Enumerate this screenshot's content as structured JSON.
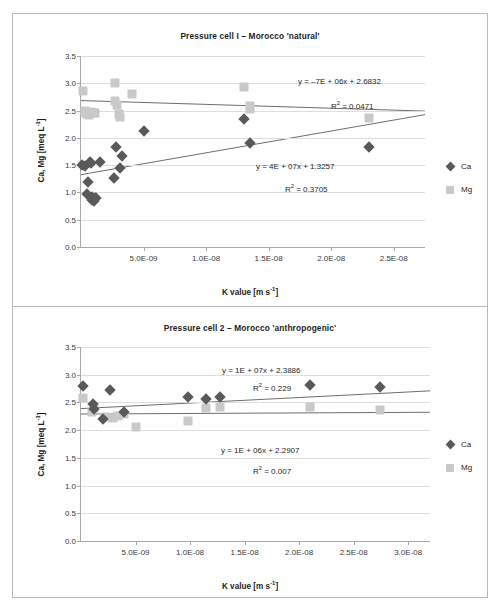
{
  "figure": {
    "panels": [
      {
        "id": "pressure-cell-1",
        "title": "Pressure cell I – Morocco 'natural'",
        "axis": {
          "x_title": "K value [m s-1]",
          "y_title": "Ca, Mg [meq L-1]",
          "x_ticks": [
            "5.0E-09",
            "1.0E-08",
            "1.5E-08",
            "2.0E-08",
            "2.5E-08"
          ],
          "y_ticks": [
            "0.0",
            "0.5",
            "1.0",
            "1.5",
            "2.0",
            "2.5",
            "3.0",
            "3.5"
          ]
        },
        "annotations": {
          "mg_equation": "y = –7E + 06x + 2.6832",
          "mg_r2": "R2 = 0.0471",
          "ca_equation": "y = 4E + 07x + 1.3257",
          "ca_r2": "R2 = 0.3705"
        },
        "legend": [
          {
            "label": "Ca",
            "marker": "diamond",
            "color": "#595959"
          },
          {
            "label": "Mg",
            "marker": "square",
            "color": "#c9c9c9"
          }
        ]
      },
      {
        "id": "pressure-cell-2",
        "title": "Pressure cell 2 – Morocco 'anthropogenic'",
        "axis": {
          "x_title": "K value [m s-1]",
          "y_title": "Ca, Mg [meq L-1]",
          "x_ticks": [
            "5.0E-09",
            "1.0E-08",
            "1.5E-08",
            "2.0E-08",
            "2.5E-08",
            "3.0E-08"
          ],
          "y_ticks": [
            "0.0",
            "0.5",
            "1.0",
            "1.5",
            "2.0",
            "2.5",
            "3.0",
            "3.5"
          ]
        },
        "annotations": {
          "ca_equation": "y = 1E + 07x + 2.3886",
          "ca_r2": "R2 = 0.229",
          "mg_equation": "y = 1E + 06x + 2.2907",
          "mg_r2": "R2 = 0.007"
        },
        "legend": [
          {
            "label": "Ca",
            "marker": "diamond",
            "color": "#595959"
          },
          {
            "label": "Mg",
            "marker": "square",
            "color": "#c9c9c9"
          }
        ]
      }
    ]
  },
  "chart_data": [
    {
      "type": "scatter",
      "title": "Pressure cell I – Morocco 'natural'",
      "xlabel": "K value [m s-1]",
      "ylabel": "Ca, Mg [meq L-1]",
      "xlim": [
        0,
        2.75e-08
      ],
      "ylim": [
        0.0,
        3.5
      ],
      "grid": true,
      "legend_position": "right",
      "series": [
        {
          "name": "Ca",
          "marker": "diamond",
          "color": "#595959",
          "points": [
            [
              1e-10,
              1.5
            ],
            [
              3e-10,
              1.48
            ],
            [
              5.5e-10,
              1.2
            ],
            [
              5e-10,
              0.98
            ],
            [
              7e-10,
              1.55
            ],
            [
              8e-10,
              1.54
            ],
            [
              8.5e-10,
              0.92
            ],
            [
              9e-10,
              0.86
            ],
            [
              1e-09,
              0.84
            ],
            [
              1.1e-09,
              0.9
            ],
            [
              1.2e-09,
              0.9
            ],
            [
              1.5e-09,
              1.55
            ],
            [
              2.6e-09,
              1.26
            ],
            [
              2.8e-09,
              1.83
            ],
            [
              3.1e-09,
              1.45
            ],
            [
              3.3e-09,
              1.66
            ],
            [
              5e-09,
              2.13
            ],
            [
              1.3e-08,
              2.34
            ],
            [
              1.35e-08,
              1.9
            ],
            [
              2.3e-08,
              1.84
            ]
          ],
          "trendline": {
            "equation": "y = 4E + 07x + 1.3257",
            "slope": 40000000.0,
            "intercept": 1.3257,
            "r2": 0.3705
          }
        },
        {
          "name": "Mg",
          "marker": "square",
          "color": "#c9c9c9",
          "points": [
            [
              1.5e-10,
              2.85
            ],
            [
              3e-10,
              2.5
            ],
            [
              4e-10,
              2.46
            ],
            [
              5e-10,
              2.44
            ],
            [
              6.5e-10,
              2.42
            ],
            [
              8e-10,
              2.47
            ],
            [
              1e-09,
              2.45
            ],
            [
              1.1e-09,
              2.46
            ],
            [
              2.7e-09,
              3.0
            ],
            [
              2.7e-09,
              2.68
            ],
            [
              2.9e-09,
              2.6
            ],
            [
              3e-09,
              2.44
            ],
            [
              3.1e-09,
              2.38
            ],
            [
              4.1e-09,
              2.8
            ],
            [
              1.3e-08,
              2.94
            ],
            [
              1.35e-08,
              2.58
            ],
            [
              1.35e-08,
              2.52
            ],
            [
              2.3e-08,
              2.36
            ]
          ],
          "trendline": {
            "equation": "y = –7E + 06x + 2.6832",
            "slope": -7000000.0,
            "intercept": 2.6832,
            "r2": 0.0471
          }
        }
      ]
    },
    {
      "type": "scatter",
      "title": "Pressure cell 2 – Morocco 'anthropogenic'",
      "xlabel": "K value [m s-1]",
      "ylabel": "Ca, Mg [meq L-1]",
      "xlim": [
        0,
        3.2e-08
      ],
      "ylim": [
        0.0,
        3.5
      ],
      "grid": true,
      "legend_position": "right",
      "series": [
        {
          "name": "Ca",
          "marker": "diamond",
          "color": "#595959",
          "points": [
            [
              1.5e-10,
              2.79
            ],
            [
              1.1e-09,
              2.47
            ],
            [
              1.2e-09,
              2.38
            ],
            [
              2e-09,
              2.21
            ],
            [
              2.7e-09,
              2.72
            ],
            [
              3.9e-09,
              2.33
            ],
            [
              9.8e-09,
              2.6
            ],
            [
              1.15e-08,
              2.56
            ],
            [
              1.27e-08,
              2.6
            ],
            [
              2.1e-08,
              2.82
            ],
            [
              2.74e-08,
              2.78
            ]
          ],
          "trendline": {
            "equation": "y = 1E + 07x + 2.3886",
            "slope": 10000000.0,
            "intercept": 2.3886,
            "r2": 0.229
          }
        },
        {
          "name": "Mg",
          "marker": "square",
          "color": "#c9c9c9",
          "points": [
            [
              1.5e-10,
              2.58
            ],
            [
              1e-09,
              2.33
            ],
            [
              1.2e-09,
              2.4
            ],
            [
              2.2e-09,
              2.23
            ],
            [
              2.9e-09,
              2.22
            ],
            [
              3.4e-09,
              2.26
            ],
            [
              3.9e-09,
              2.3
            ],
            [
              5e-09,
              2.05
            ],
            [
              9.8e-09,
              2.17
            ],
            [
              1.15e-08,
              2.4
            ],
            [
              1.27e-08,
              2.42
            ],
            [
              2.1e-08,
              2.42
            ],
            [
              2.74e-08,
              2.37
            ]
          ],
          "trendline": {
            "equation": "y = 1E + 06x + 2.2907",
            "slope": 1000000.0,
            "intercept": 2.2907,
            "r2": 0.007
          }
        }
      ]
    }
  ]
}
